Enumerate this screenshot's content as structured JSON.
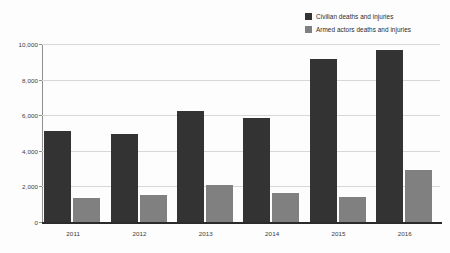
{
  "chart_data": {
    "type": "bar",
    "title": "",
    "subtitle": "",
    "xlabel": "",
    "ylabel": "",
    "categories": [
      "2011",
      "2012",
      "2013",
      "2014",
      "2015",
      "2016"
    ],
    "series": [
      {
        "name": "Civilian deaths and injuries",
        "color": "#333333",
        "values": [
          5100,
          4950,
          6250,
          5850,
          9150,
          9650
        ]
      },
      {
        "name": "Armed actors deaths and injuries",
        "color": "#808080",
        "values": [
          1350,
          1500,
          2100,
          1650,
          1400,
          2900
        ]
      }
    ],
    "ylim": [
      0,
      10000
    ],
    "yticks": [
      0,
      2000,
      4000,
      6000,
      8000,
      10000
    ],
    "ytick_labels": [
      "0",
      "2,000",
      "4,000",
      "6,000",
      "8,000",
      "10,000"
    ],
    "grid": true,
    "legend_position": "top-right"
  },
  "legend": {
    "items": [
      {
        "label": "Civilian deaths and injuries",
        "color": "#333333"
      },
      {
        "label": "Armed actors deaths and injuries",
        "color": "#808080"
      }
    ]
  },
  "axes": {
    "y_tick_labels": [
      "10,000",
      "8,000",
      "6,000",
      "4,000",
      "2,000",
      "0"
    ],
    "x_tick_labels": [
      "2011",
      "2012",
      "2013",
      "2014",
      "2015",
      "2016"
    ]
  }
}
